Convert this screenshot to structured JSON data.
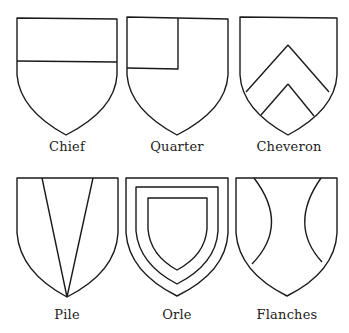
{
  "figure": {
    "stroke_color": "#1a1a1a",
    "background": "#ffffff",
    "shields": [
      {
        "name": "Chief",
        "label": "Chief"
      },
      {
        "name": "Quarter",
        "label": "Quarter"
      },
      {
        "name": "Cheveron",
        "label": "Cheveron"
      },
      {
        "name": "Pile",
        "label": "Pile"
      },
      {
        "name": "Orle",
        "label": "Orle"
      },
      {
        "name": "Flanches",
        "label": "Flanches"
      }
    ]
  }
}
